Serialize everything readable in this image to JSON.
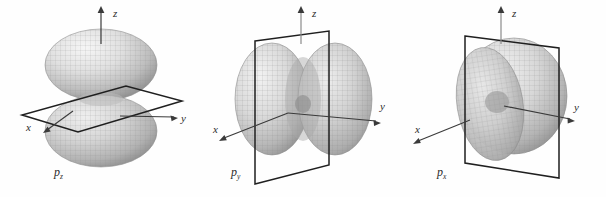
{
  "figure": {
    "background_color": "#fefefe",
    "line_color": "#2b2b2b",
    "surface_light": "#f2f2f2",
    "surface_mid": "#c9c9c9",
    "surface_dark": "#8e8e8e",
    "panels": [
      {
        "id": "panel-pz",
        "orbital_label": "p",
        "orbital_subscript": "z",
        "axes": [
          {
            "name": "z",
            "label": "z"
          },
          {
            "name": "y",
            "label": "y"
          },
          {
            "name": "x",
            "label": "x"
          }
        ],
        "nodal_plane": "xy-plane",
        "lobe_orientation": "vertical",
        "lobe_count": 2
      },
      {
        "id": "panel-py",
        "orbital_label": "p",
        "orbital_subscript": "y",
        "axes": [
          {
            "name": "z",
            "label": "z"
          },
          {
            "name": "y",
            "label": "y"
          },
          {
            "name": "x",
            "label": "x"
          }
        ],
        "nodal_plane": "xz-plane",
        "lobe_orientation": "along-y",
        "lobe_count": 2
      },
      {
        "id": "panel-px",
        "orbital_label": "p",
        "orbital_subscript": "x",
        "axes": [
          {
            "name": "z",
            "label": "z"
          },
          {
            "name": "y",
            "label": "y"
          },
          {
            "name": "x",
            "label": "x"
          }
        ],
        "nodal_plane": "yz-plane",
        "lobe_orientation": "along-x",
        "lobe_count": 2
      }
    ]
  }
}
